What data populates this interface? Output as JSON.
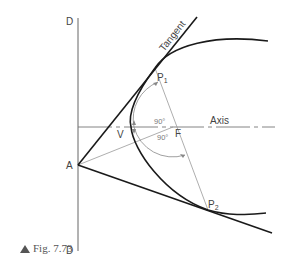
{
  "figure": {
    "caption": "Fig. 7.73",
    "labels": {
      "directrix_top": "D",
      "directrix_bottom": "D",
      "point_a": "A",
      "vertex": "V",
      "focus": "F",
      "p1": "P",
      "p1_sub": "1",
      "p2": "P",
      "p2_sub": "2",
      "axis": "Axis",
      "tangent": "Tangent",
      "angle_upper": "90°",
      "angle_lower": "90°"
    },
    "colors": {
      "curve": "#1a1a1a",
      "construction": "#888888",
      "text": "#444444"
    }
  }
}
